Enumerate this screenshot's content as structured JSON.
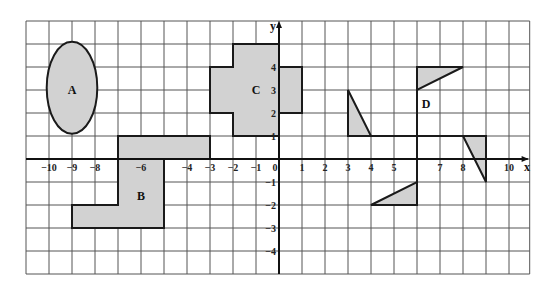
{
  "diagram": {
    "type": "coordinate-grid",
    "colors": {
      "grid": "#555555",
      "axis": "#111111",
      "shape_fill": "#d2d2d2",
      "shape_stroke": "#1a1a1a"
    },
    "grid": {
      "x_min": -11,
      "x_max": 10.9,
      "y_min": -5,
      "y_max": 6,
      "origin_px": [
        279,
        159
      ],
      "unit_px": 23
    },
    "axes": {
      "x_label": "x",
      "y_label": "y",
      "x_ticks": [
        {
          "value": -10,
          "label": "−10"
        },
        {
          "value": -9,
          "label": "−9"
        },
        {
          "value": -8,
          "label": "−8"
        },
        {
          "value": -6,
          "label": "−6"
        },
        {
          "value": -4,
          "label": "−4"
        },
        {
          "value": -3,
          "label": "−3"
        },
        {
          "value": -2,
          "label": "−2"
        },
        {
          "value": -1,
          "label": "−1"
        },
        {
          "value": 0,
          "label": "0"
        },
        {
          "value": 1,
          "label": "1"
        },
        {
          "value": 2,
          "label": "2"
        },
        {
          "value": 3,
          "label": "3"
        },
        {
          "value": 4,
          "label": "4"
        },
        {
          "value": 5,
          "label": "5"
        },
        {
          "value": 7,
          "label": "7"
        },
        {
          "value": 8,
          "label": "8"
        },
        {
          "value": 10,
          "label": "10"
        }
      ],
      "y_ticks": [
        {
          "value": 4,
          "label": "4"
        },
        {
          "value": 3,
          "label": "3"
        },
        {
          "value": 2,
          "label": "2"
        },
        {
          "value": 1,
          "label": "1"
        },
        {
          "value": -1,
          "label": "−1"
        },
        {
          "value": -2,
          "label": "−2"
        },
        {
          "value": -3,
          "label": "−3"
        },
        {
          "value": -4,
          "label": "−4"
        }
      ]
    },
    "shapes": [
      {
        "name": "A",
        "kind": "ellipse",
        "center": [
          -9,
          3.1
        ],
        "rx": 1.1,
        "ry": 2.0,
        "label_pos": [
          -9,
          3
        ]
      },
      {
        "name": "B",
        "kind": "polygon",
        "points": [
          [
            -7,
            1
          ],
          [
            -3,
            1
          ],
          [
            -3,
            0
          ],
          [
            -5,
            0
          ],
          [
            -5,
            -3
          ],
          [
            -9,
            -3
          ],
          [
            -9,
            -2
          ],
          [
            -7,
            -2
          ]
        ],
        "inner_lines": [
          [
            [
              -7,
              0
            ],
            [
              -5,
              0
            ]
          ]
        ],
        "label_pos": [
          -6,
          -1.6
        ]
      },
      {
        "name": "C",
        "kind": "polygon",
        "points": [
          [
            -2,
            5
          ],
          [
            0,
            5
          ],
          [
            0,
            4
          ],
          [
            1,
            4
          ],
          [
            1,
            2
          ],
          [
            0,
            2
          ],
          [
            0,
            1
          ],
          [
            -2,
            1
          ],
          [
            -2,
            2
          ],
          [
            -3,
            2
          ],
          [
            -3,
            4
          ],
          [
            -2,
            4
          ]
        ],
        "label_pos": [
          -1,
          3
        ]
      },
      {
        "name": "D",
        "kind": "pinwheel",
        "triangles": [
          [
            [
              3,
              3
            ],
            [
              3,
              1
            ],
            [
              4,
              1
            ]
          ],
          [
            [
              6,
              4
            ],
            [
              8,
              4
            ],
            [
              6,
              3
            ]
          ],
          [
            [
              8,
              1
            ],
            [
              9,
              1
            ],
            [
              9,
              -1
            ]
          ],
          [
            [
              4,
              -2
            ],
            [
              6,
              -2
            ],
            [
              6,
              -1
            ]
          ]
        ],
        "lines": [
          [
            [
              3,
              1
            ],
            [
              9,
              1
            ]
          ],
          [
            [
              6,
              -2
            ],
            [
              6,
              4
            ]
          ]
        ],
        "label_pos": [
          6.4,
          2.4
        ]
      }
    ]
  }
}
